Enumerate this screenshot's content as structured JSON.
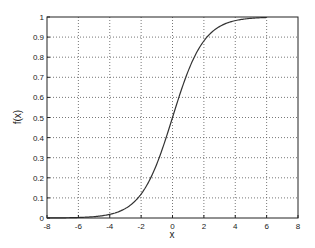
{
  "chart_data": {
    "type": "line",
    "title": "",
    "xlabel": "x",
    "ylabel": "f(x)",
    "xlim": [
      -8,
      8
    ],
    "ylim": [
      0,
      1
    ],
    "xticks": [
      -8,
      -6,
      -4,
      -2,
      0,
      2,
      4,
      6,
      8
    ],
    "xtick_labels": [
      "-8",
      "-6",
      "-4",
      "-2",
      "0",
      "2",
      "4",
      "6",
      "8"
    ],
    "yticks": [
      0,
      0.1,
      0.2,
      0.3,
      0.4,
      0.5,
      0.6,
      0.7,
      0.8,
      0.9,
      1
    ],
    "ytick_labels": [
      "0",
      "0.1",
      "0.2",
      "0.3",
      "0.4",
      "0.5",
      "0.6",
      "0.7",
      "0.8",
      "0.9",
      "1"
    ],
    "grid": true,
    "grid_style": "dotted",
    "legend": null,
    "series": [
      {
        "name": "f(x) = 1/(1+e^-x)",
        "color": "#333333",
        "x": [
          -8,
          -7,
          -6,
          -5,
          -4,
          -3,
          -2.5,
          -2,
          -1.5,
          -1,
          -0.5,
          0,
          0.5,
          1,
          1.5,
          2,
          2.5,
          3,
          4,
          5,
          6
        ],
        "y": [
          0.0003,
          0.0009,
          0.0025,
          0.0067,
          0.018,
          0.047,
          0.076,
          0.119,
          0.182,
          0.269,
          0.378,
          0.5,
          0.622,
          0.731,
          0.818,
          0.881,
          0.924,
          0.953,
          0.982,
          0.993,
          0.9975
        ]
      }
    ]
  }
}
